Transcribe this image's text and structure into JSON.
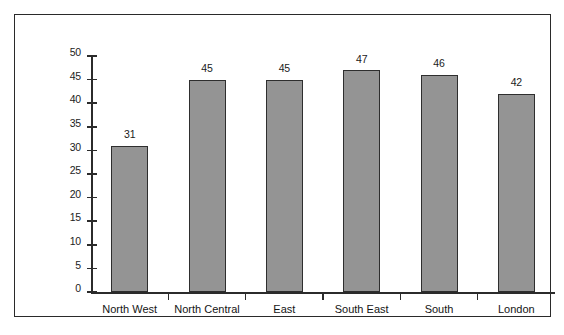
{
  "chart_data": {
    "type": "bar",
    "title": "",
    "subtitle": "",
    "xlabel": "",
    "ylabel": "Admissions",
    "categories": [
      "North West",
      "North Central",
      "East",
      "South East",
      "South",
      "London"
    ],
    "values": [
      31,
      45,
      45,
      47,
      46,
      42
    ],
    "value_labels": [
      "31",
      "45",
      "45",
      "47",
      "46",
      "42"
    ],
    "ylim": [
      0,
      50
    ],
    "ytick_step": 5,
    "ytick_labels": [
      "0",
      "5",
      "10",
      "15",
      "20",
      "25",
      "30",
      "35",
      "40",
      "45",
      "50"
    ],
    "ytick_values": [
      0,
      5,
      10,
      15,
      20,
      25,
      30,
      35,
      40,
      45,
      50
    ],
    "grid": false,
    "legend": null,
    "legend_position": "none",
    "series": [
      {
        "name": "Admissions",
        "values": [
          31,
          45,
          45,
          47,
          46,
          42
        ]
      }
    ],
    "colors": {
      "bar_fill": "#949494",
      "bar_border": "#2e2e2e",
      "axis": "#2b2b2b",
      "text": "#141414",
      "frame": "#2a2a2a",
      "background": "#ffffff"
    }
  }
}
